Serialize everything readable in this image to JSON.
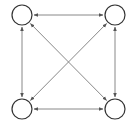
{
  "diagram": {
    "type": "complete-graph",
    "directed": "bidirectional",
    "colors": {
      "background": "#ffffff",
      "node_stroke": "#333333",
      "node_fill": "#ffffff",
      "edge_stroke": "#7a7a7a",
      "arrowhead": "#555555"
    },
    "nodes": [
      {
        "id": "top-left",
        "cx": 22,
        "cy": 15,
        "r": 10,
        "label": ""
      },
      {
        "id": "top-right",
        "cx": 115,
        "cy": 15,
        "r": 10,
        "label": ""
      },
      {
        "id": "bottom-left",
        "cx": 22,
        "cy": 109,
        "r": 10,
        "label": ""
      },
      {
        "id": "bottom-right",
        "cx": 115,
        "cy": 109,
        "r": 10,
        "label": ""
      }
    ],
    "edges": [
      {
        "id": "top",
        "from": "top-left",
        "to": "top-right",
        "arrows": "both"
      },
      {
        "id": "bottom",
        "from": "bottom-left",
        "to": "bottom-right",
        "arrows": "both"
      },
      {
        "id": "left",
        "from": "top-left",
        "to": "bottom-left",
        "arrows": "both"
      },
      {
        "id": "right",
        "from": "top-right",
        "to": "bottom-right",
        "arrows": "both"
      },
      {
        "id": "diag-main",
        "from": "top-left",
        "to": "bottom-right",
        "arrows": "both"
      },
      {
        "id": "diag-anti",
        "from": "top-right",
        "to": "bottom-left",
        "arrows": "both"
      }
    ]
  }
}
